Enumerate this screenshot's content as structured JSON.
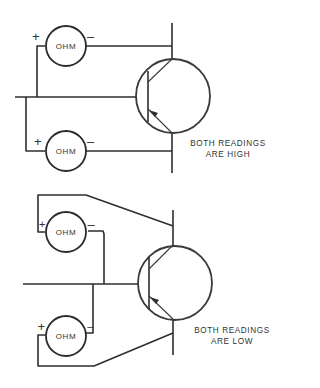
{
  "diagram": {
    "top": {
      "meters": [
        {
          "label": "OHM",
          "plus": "+",
          "minus": "–"
        },
        {
          "label": "OHM",
          "plus": "+",
          "minus": "–"
        }
      ],
      "caption_line1": "BOTH READINGS",
      "caption_line2": "ARE HIGH"
    },
    "bottom": {
      "meters": [
        {
          "label": "OHM",
          "plus": "+",
          "minus": "–"
        },
        {
          "label": "OHM",
          "plus": "+",
          "minus": "–"
        }
      ],
      "caption_line1": "BOTH READINGS",
      "caption_line2": "ARE LOW"
    }
  }
}
